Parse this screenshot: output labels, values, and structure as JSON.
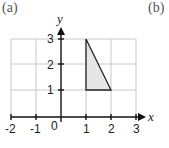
{
  "panel_labels": {
    "left": "(a)",
    "right": "(b)"
  },
  "axes": {
    "x_label": "x",
    "y_label": "y",
    "x_ticks": [
      "-2",
      "-1",
      "1",
      "2",
      "3"
    ],
    "y_ticks": [
      "1",
      "2",
      "3"
    ],
    "origin_label": "0",
    "x_range": [
      -2,
      3
    ],
    "y_range": [
      0,
      3
    ]
  },
  "shape": {
    "type": "triangle",
    "vertices": [
      [
        1,
        3
      ],
      [
        1,
        1
      ],
      [
        2,
        1
      ]
    ],
    "fill": "#e6e6e6",
    "stroke": "#222222"
  },
  "colors": {
    "grid": "#c8c8c8",
    "axis": "#111111"
  }
}
